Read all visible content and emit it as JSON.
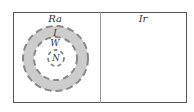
{
  "panels": {
    "left": {
      "title": "Ra"
    },
    "right": {
      "title": "Ir"
    }
  },
  "diagram": {
    "layers": [
      {
        "label": "I",
        "role": "outer gray dashed ring"
      },
      {
        "label": "W",
        "role": "white region inside ring"
      },
      {
        "label": "N",
        "role": "innermost dashed circle"
      }
    ],
    "colors": {
      "ring_fill": "#cccccc",
      "dash": "#888888",
      "frame": "#555555",
      "divider": "#999999"
    }
  }
}
